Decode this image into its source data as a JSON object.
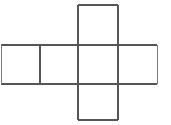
{
  "figure": {
    "name": "cube-net",
    "title": "Cube net diagram",
    "background_color": "#ffffff",
    "line_color": "#555555",
    "line_color_light": "#7a7a7a",
    "line_width": 1.1,
    "cell_size": 39,
    "grid": {
      "columns": 4,
      "rows": 3,
      "origin_x": 1,
      "origin_y": 5,
      "column_x": [
        1,
        40,
        78,
        118,
        157
      ],
      "row_y": [
        5,
        45,
        84,
        120
      ]
    },
    "cells": [
      {
        "id": "cell-top",
        "label": "",
        "column": 2,
        "row": 0,
        "x": 78,
        "y": 5,
        "width": 40,
        "height": 40
      },
      {
        "id": "cell-row-1",
        "label": "",
        "column": 0,
        "row": 1,
        "x": 1,
        "y": 45,
        "width": 39,
        "height": 39
      },
      {
        "id": "cell-row-2",
        "label": "",
        "column": 1,
        "row": 1,
        "x": 40,
        "y": 45,
        "width": 38,
        "height": 39
      },
      {
        "id": "cell-row-3",
        "label": "",
        "column": 2,
        "row": 1,
        "x": 78,
        "y": 45,
        "width": 40,
        "height": 39
      },
      {
        "id": "cell-row-4",
        "label": "",
        "column": 3,
        "row": 1,
        "x": 118,
        "y": 45,
        "width": 39,
        "height": 39
      },
      {
        "id": "cell-bottom",
        "label": "",
        "column": 2,
        "row": 2,
        "x": 78,
        "y": 84,
        "width": 40,
        "height": 36
      }
    ],
    "segments": {
      "horizontal": [
        {
          "id": "h-top",
          "x1": 78,
          "x2": 118,
          "y": 5
        },
        {
          "id": "h-upper-band",
          "x1": 1,
          "x2": 157,
          "y": 45
        },
        {
          "id": "h-lower-band",
          "x1": 1,
          "x2": 157,
          "y": 84
        },
        {
          "id": "h-bottom",
          "x1": 78,
          "x2": 118,
          "y": 120
        }
      ],
      "vertical": [
        {
          "id": "v-left-outer",
          "x": 1,
          "y1": 45,
          "y2": 84
        },
        {
          "id": "v-inner-1",
          "x": 40,
          "y1": 45,
          "y2": 84
        },
        {
          "id": "v-column-left",
          "x": 78,
          "y1": 5,
          "y2": 120
        },
        {
          "id": "v-column-right",
          "x": 118,
          "y1": 5,
          "y2": 120
        },
        {
          "id": "v-right-outer",
          "x": 157,
          "y1": 45,
          "y2": 84
        }
      ]
    }
  }
}
